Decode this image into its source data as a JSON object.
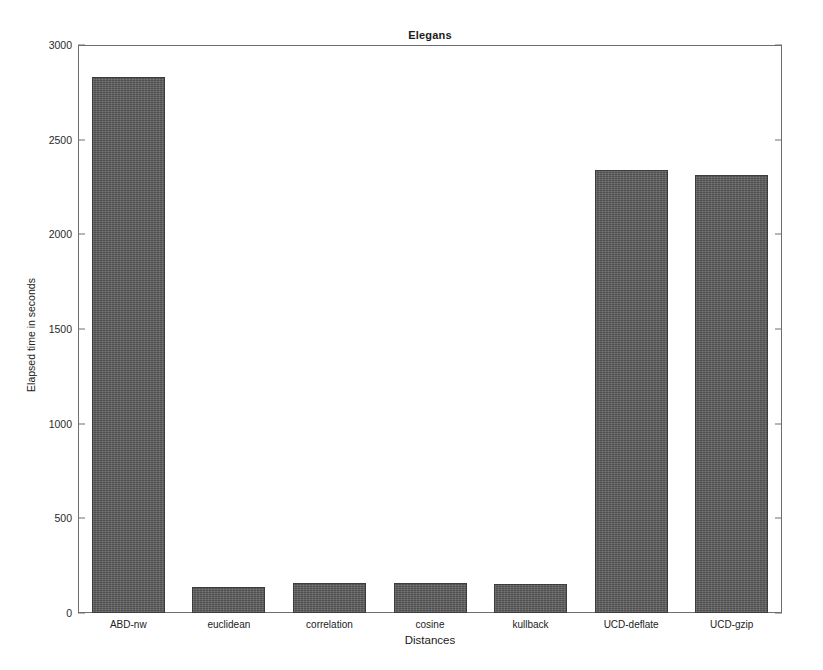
{
  "chart_data": {
    "type": "bar",
    "title": "Elegans",
    "xlabel": "Distances",
    "ylabel": "Elapsed time in seconds",
    "categories": [
      "ABD-nw",
      "euclidean",
      "correlation",
      "cosine",
      "kullback",
      "UCD-deflate",
      "UCD-gzip"
    ],
    "values": [
      2830,
      137,
      158,
      160,
      155,
      2340,
      2315
    ],
    "ylim": [
      0,
      3000
    ],
    "yticks": [
      0,
      500,
      1000,
      1500,
      2000,
      2500,
      3000
    ],
    "ytick_labels": [
      "0",
      "500",
      "1000",
      "1500",
      "2000",
      "2500",
      "3000"
    ],
    "grid": false,
    "legend": null,
    "bar_color": "#595959",
    "bar_edge_color": "#3c3c3c",
    "axis_color": "#6e6e6e",
    "background_color": "#ffffff"
  }
}
